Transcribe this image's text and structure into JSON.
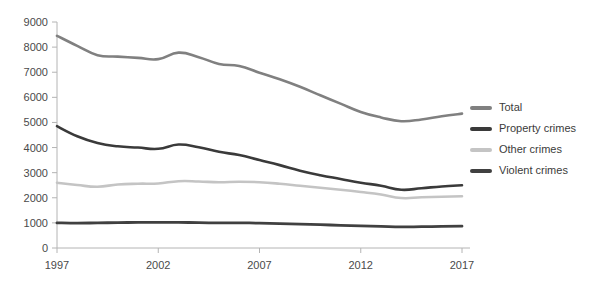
{
  "chart_data": {
    "type": "line",
    "title": "",
    "subtitle": "",
    "xlabel": "",
    "ylabel": "",
    "xlim": [
      1997,
      2017
    ],
    "ylim": [
      0,
      9000
    ],
    "grid": false,
    "legend_position": "right",
    "x": [
      1997,
      1998,
      1999,
      2000,
      2001,
      2002,
      2003,
      2004,
      2005,
      2006,
      2007,
      2008,
      2009,
      2010,
      2011,
      2012,
      2013,
      2014,
      2015,
      2016,
      2017
    ],
    "x_tick_labels": [
      "1997",
      "2002",
      "2007",
      "2012",
      "2017"
    ],
    "x_ticks": [
      1997,
      2002,
      2007,
      2012,
      2017
    ],
    "y_ticks": [
      0,
      1000,
      2000,
      3000,
      4000,
      5000,
      6000,
      7000,
      8000,
      9000
    ],
    "y_tick_labels": [
      "0",
      "1000",
      "2000",
      "3000",
      "4000",
      "5000",
      "6000",
      "7000",
      "8000",
      "9000"
    ],
    "series": [
      {
        "name": "Total",
        "color": "#808080",
        "width": 2.6,
        "values": [
          8450,
          8050,
          7680,
          7620,
          7570,
          7520,
          7780,
          7600,
          7330,
          7250,
          6980,
          6720,
          6420,
          6080,
          5750,
          5420,
          5200,
          5050,
          5120,
          5250,
          5350
        ]
      },
      {
        "name": "Property crimes",
        "color": "#3a3a3a",
        "width": 2.6,
        "values": [
          4850,
          4450,
          4180,
          4050,
          4000,
          3950,
          4120,
          4010,
          3830,
          3700,
          3500,
          3300,
          3080,
          2900,
          2750,
          2600,
          2480,
          2320,
          2380,
          2450,
          2500
        ]
      },
      {
        "name": "Other crimes",
        "color": "#c4c4c4",
        "width": 2.6,
        "values": [
          2600,
          2510,
          2440,
          2530,
          2560,
          2570,
          2660,
          2650,
          2620,
          2640,
          2620,
          2560,
          2480,
          2400,
          2320,
          2230,
          2130,
          1990,
          2020,
          2040,
          2060
        ]
      },
      {
        "name": "Violent crimes",
        "color": "#404040",
        "width": 2.8,
        "values": [
          1000,
          990,
          1000,
          1010,
          1020,
          1020,
          1020,
          1010,
          1000,
          1000,
          990,
          970,
          950,
          930,
          900,
          880,
          860,
          840,
          850,
          860,
          870
        ]
      }
    ]
  },
  "legend": {
    "items": [
      {
        "label": "Total",
        "color": "#808080"
      },
      {
        "label": "Property crimes",
        "color": "#3a3a3a"
      },
      {
        "label": "Other crimes",
        "color": "#c4c4c4"
      },
      {
        "label": "Violent crimes",
        "color": "#404040"
      }
    ]
  }
}
